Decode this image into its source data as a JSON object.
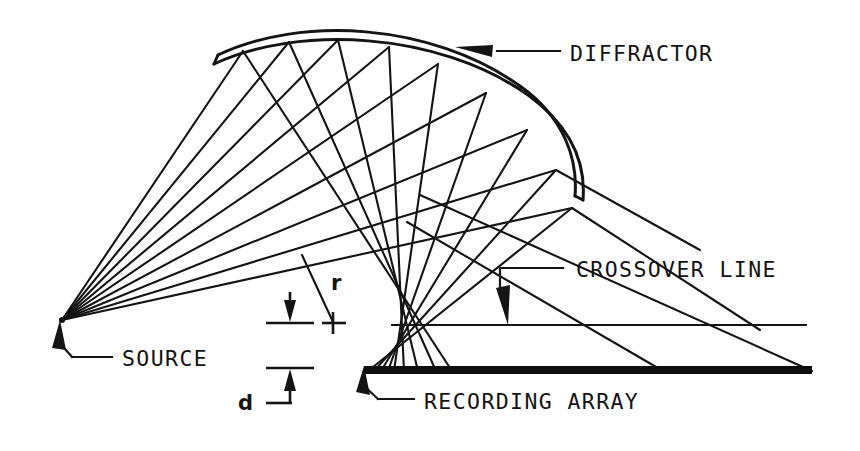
{
  "figure": {
    "background_color": "#ffffff",
    "ink_color": "#131313",
    "width": 860,
    "height": 451
  },
  "labels": {
    "diffractor": "DIFFRACTOR",
    "crossover_line": "CROSSOVER LINE",
    "source": "SOURCE",
    "recording_array": "RECORDING ARRAY",
    "radius_symbol": "r",
    "depth_symbol": "d"
  },
  "elements": {
    "source_point": "source-point",
    "incident_ray_fan": "incident-rays",
    "reflected_ray_fan": "reflected-rays",
    "diffractor_arc": "diffractor-arc",
    "crossover_rule": "crossover-rule",
    "array_bar": "recording-array-bar",
    "radius_line": "radius-line",
    "depth_dimension": "depth-dimension"
  },
  "geometry": {
    "source_x": 62,
    "source_y": 320,
    "crossover_y": 325,
    "array_y": 371,
    "array_x_start": 364,
    "array_x_end": 812,
    "incident_ray_count": 9,
    "reflected_ray_count": 9
  }
}
